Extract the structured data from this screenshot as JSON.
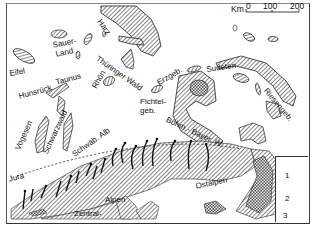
{
  "map": {
    "type": "geological sketch map (Central European uplands and Alps)",
    "scale_bar": {
      "unit_label": "Km",
      "ticks": [
        "0",
        "100",
        "200"
      ]
    },
    "labels": {
      "harz": "Harz",
      "sauerland": "Sauer-\nLand",
      "sauer": "Sauer-",
      "land": "Land",
      "eifel": "Eifel",
      "hunsrueck": "Hunsrück",
      "taunus": "Taunus",
      "rhoen": "Rhön",
      "thueringer_wald": "Thüringer Wald",
      "erzgeb": "Erzgeb.",
      "sudeten": "Sudeten",
      "riesengeb": "Riesengeb.",
      "fichtel": "Fichtel-",
      "geb": "geb.",
      "boehm_bayer_w": "Böhm.- Bayer. W.",
      "vogesen": "Vogesen",
      "schwarzwald": "Schwarzwald",
      "schwaeb_alb": "Schwäb. Alb",
      "jura": "Jura",
      "alpen": "Alpen",
      "zentral": "Zentral-",
      "ostalpen": "Ostalpen"
    },
    "legend": {
      "items": [
        {
          "number": "1",
          "symbol": "light-hatched area"
        },
        {
          "number": "2",
          "symbol": "dense-hatched area"
        },
        {
          "number": "3",
          "symbol": "arrow"
        }
      ]
    },
    "colors": {
      "ink": "#1a1a1a",
      "paper": "#ffffff"
    }
  }
}
